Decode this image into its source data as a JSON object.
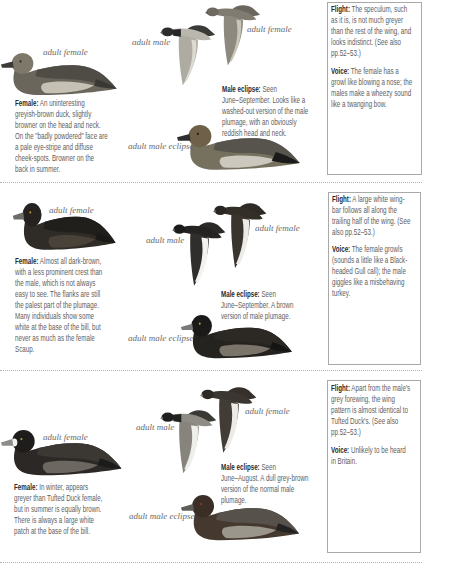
{
  "sections": [
    {
      "labels": {
        "sitting_female": "adult female",
        "flight_male": "adult male",
        "flight_female": "adult female",
        "eclipse_male": "adult male eclipse"
      },
      "female": {
        "heading": "Female:",
        "lines": [
          " An uninteresting",
          "greyish-brown duck, slightly",
          "browner on the head and neck.",
          "On the \"badly powdered\" face are",
          "a pale eye-stripe and diffuse",
          "cheek-spots. Browner on the",
          "back in summer."
        ]
      },
      "male_eclipse": {
        "heading": "Male eclipse:",
        "lines": [
          " Seen",
          "June–September. Looks like a",
          "washed-out version of the male",
          "plumage, with an obviously",
          "reddish head and neck."
        ]
      },
      "sidebar": {
        "flight": {
          "heading": "Flight:",
          "lines": [
            " The speculum, such",
            "as it is, is not much greyer",
            "than the rest of the wing, and",
            "looks indistinct. (See also",
            "pp.52–53.)"
          ]
        },
        "voice": {
          "heading": "Voice:",
          "lines": [
            " The female has a",
            "growl like blowing a nose; the",
            "males make a wheezy sound",
            "like a twanging bow."
          ]
        }
      }
    },
    {
      "labels": {
        "sitting_female": "adult female",
        "flight_male": "adult male",
        "flight_female": "adult female",
        "eclipse_male": "adult male eclipse"
      },
      "female": {
        "heading": "Female:",
        "lines": [
          " Almost all dark-brown,",
          "with a less prominent crest than",
          "the male, which is not always",
          "easy to see. The flanks are still",
          "the palest part of the plumage.",
          "Many individuals show some",
          "white at the base of the bill, but",
          "never as much as the female",
          "Scaup."
        ]
      },
      "male_eclipse": {
        "heading": "Male eclipse:",
        "lines": [
          " Seen",
          "June–September. A brown",
          "version of male plumage."
        ]
      },
      "sidebar": {
        "flight": {
          "heading": "Flight:",
          "lines": [
            " A large white wing-",
            "bar follows all along the",
            "trailing half of the wing. (See",
            "also pp.52–53.)"
          ]
        },
        "voice": {
          "heading": "Voice:",
          "lines": [
            " The female growls",
            "(sounds a little like a Black-",
            "headed Gull call); the male",
            "giggles like a misbehaving",
            "turkey."
          ]
        }
      }
    },
    {
      "labels": {
        "sitting_female": "adult female",
        "flight_male": "adult male",
        "flight_female": "adult female",
        "eclipse_male": "adult male eclipse"
      },
      "female": {
        "heading": "Female:",
        "lines": [
          " In winter, appears",
          "greyer than Tufted Duck female,",
          "but in summer is equally brown.",
          "There is always a large white",
          "patch at the base of the bill."
        ]
      },
      "male_eclipse": {
        "heading": "Male eclipse:",
        "lines": [
          " Seen",
          "June–August. A dull grey-brown",
          "version of the normal male",
          "plumage."
        ]
      },
      "sidebar": {
        "flight": {
          "heading": "Flight:",
          "lines": [
            " Apart from the male's",
            "grey forewing, the wing",
            "pattern is almost identical to",
            "Tufted Duck's. (See also",
            "pp.52–53.)"
          ]
        },
        "voice": {
          "heading": "Voice:",
          "lines": [
            " Unlikely to be heard",
            "in Britain."
          ]
        }
      }
    }
  ]
}
